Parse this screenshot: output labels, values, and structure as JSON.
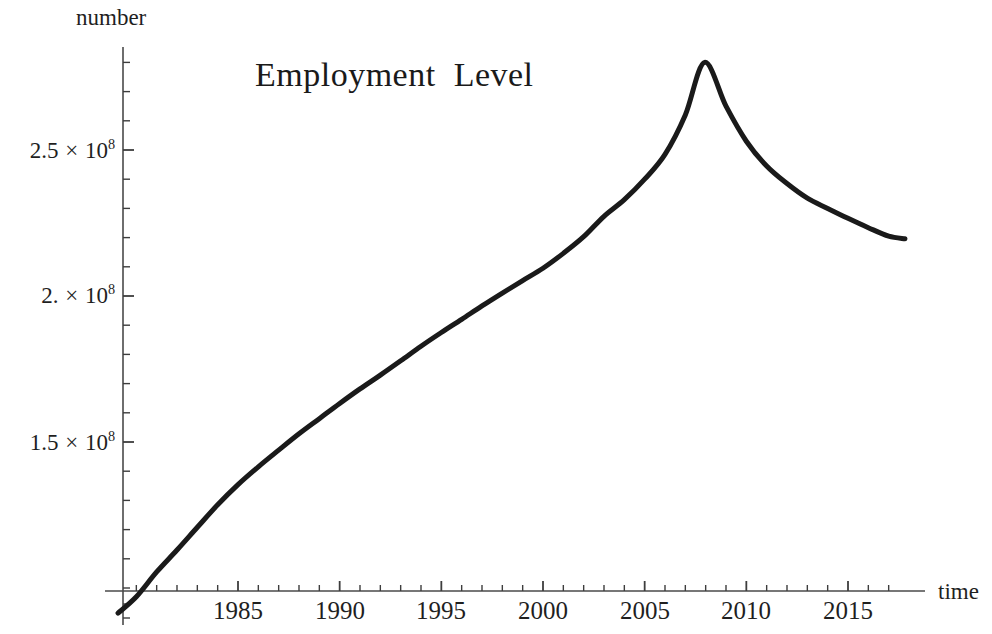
{
  "chart_data": {
    "type": "line",
    "title": "Employment  Level",
    "xlabel": "time",
    "ylabel": "number",
    "xlim": [
      1979.1,
      2017.9
    ],
    "ylim": [
      91000000,
      285000000
    ],
    "grid": false,
    "legend": null,
    "x_major_ticks": [
      1985,
      1990,
      1995,
      2000,
      2005,
      2010,
      2015
    ],
    "x_major_tick_labels": [
      "1985",
      "1990",
      "1995",
      "2000",
      "2005",
      "2010",
      "2015"
    ],
    "x_minor_tick_step": 1,
    "y_major_ticks": [
      150000000,
      200000000,
      250000000
    ],
    "y_major_tick_labels": [
      "1.5 × 10⁸",
      "2. × 10⁸",
      "2.5 × 10⁸"
    ],
    "y_minor_tick_step": 10000000,
    "line_color": "#1a1a1a",
    "line_width": 5,
    "series": [
      {
        "name": "Employment Level",
        "x": [
          1979.1,
          1980,
          1981,
          1982,
          1983,
          1984,
          1985,
          1986,
          1987,
          1988,
          1989,
          1990,
          1991,
          1992,
          1993,
          1994,
          1995,
          1996,
          1997,
          1998,
          1999,
          2000,
          2001,
          2002,
          2003,
          2004,
          2005,
          2006,
          2007,
          2007.95,
          2009,
          2010,
          2011,
          2012,
          2013,
          2014,
          2015,
          2016,
          2017,
          2017.8
        ],
        "y": [
          91400000,
          97000000,
          105500000,
          113000000,
          120800000,
          128500000,
          135400000,
          141500000,
          147200000,
          152800000,
          158000000,
          163200000,
          168200000,
          172900000,
          177800000,
          182800000,
          187500000,
          192000000,
          196600000,
          201000000,
          205300000,
          209500000,
          214600000,
          220300000,
          227300000,
          233000000,
          240000000,
          248500000,
          262000000,
          280000000,
          265000000,
          253000000,
          244500000,
          238500000,
          233500000,
          230000000,
          226600000,
          223400000,
          220500000,
          219600000
        ]
      }
    ]
  },
  "yaxis_ticklabels": [
    {
      "value": "2.5",
      "factor": "×",
      "base": "10",
      "exp": "8",
      "px_y": 150
    },
    {
      "value": "2.",
      "factor": "×",
      "base": "10",
      "exp": "8",
      "px_y": 295
    },
    {
      "value": "1.5",
      "factor": "×",
      "base": "10",
      "exp": "8",
      "px_y": 442
    }
  ],
  "xaxis_ticklabels": [
    {
      "label": "1985",
      "px_x": 238
    },
    {
      "label": "1990",
      "px_x": 340
    },
    {
      "label": "1995",
      "px_x": 441
    },
    {
      "label": "2000",
      "px_x": 543
    },
    {
      "label": "2005",
      "px_x": 645
    },
    {
      "label": "2010",
      "px_x": 746
    },
    {
      "label": "2015",
      "px_x": 848
    }
  ]
}
